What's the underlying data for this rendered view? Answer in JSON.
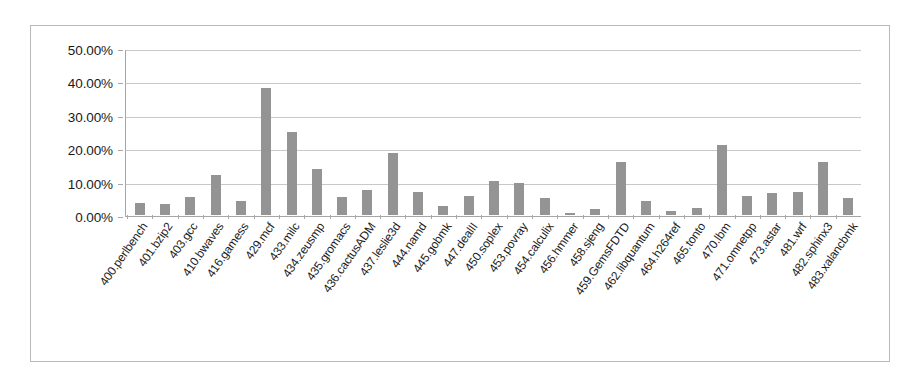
{
  "chart_data": {
    "type": "bar",
    "title": "",
    "subtitle": "",
    "xlabel": "",
    "ylabel": "",
    "ylim": [
      0,
      50
    ],
    "ytick_labels": [
      "50.00%",
      "40.00%",
      "30.00%",
      "20.00%",
      "10.00%",
      "0.00%"
    ],
    "ytick_values": [
      50,
      40,
      30,
      20,
      10,
      0
    ],
    "grid": true,
    "legend": "none",
    "series_color": "#949494",
    "categories": [
      "400.perlbench",
      "401.bzip2",
      "403.gcc",
      "410.bwaves",
      "416.gamess",
      "429.mcf",
      "433.milc",
      "434.zeusmp",
      "435.gromacs",
      "436.cactusADM",
      "437.leslie3d",
      "444.namd",
      "445.gobmk",
      "447.dealII",
      "450.soplex",
      "453.povray",
      "454.calculix",
      "456.hmmer",
      "458.sjeng",
      "459.GemsFDTD",
      "462.libquantum",
      "464.h264ref",
      "465.tonto",
      "470.lbm",
      "471.omnetpp",
      "473.astar",
      "481.wrf",
      "482.sphinx3",
      "483.xalancbmk"
    ],
    "values": [
      3.5,
      3.4,
      5.5,
      12.0,
      4.2,
      38.0,
      25.0,
      13.8,
      5.3,
      7.5,
      18.5,
      7.0,
      2.7,
      5.8,
      10.3,
      9.7,
      5.2,
      0.6,
      1.7,
      16.0,
      4.2,
      1.2,
      2.2,
      21.0,
      5.8,
      6.5,
      6.8,
      15.8,
      5.0
    ]
  }
}
